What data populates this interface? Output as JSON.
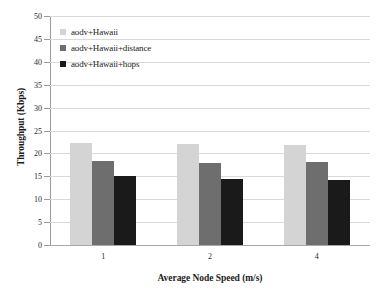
{
  "chart_data": {
    "type": "bar",
    "title": "",
    "xlabel": "Average Node Speed (m/s)",
    "ylabel": "Throughput (Kbps)",
    "categories": [
      "1",
      "2",
      "4"
    ],
    "series": [
      {
        "name": "aodv+Hawaii",
        "color": "#d4d4d4",
        "values": [
          22.2,
          22.0,
          21.8
        ]
      },
      {
        "name": "aodv+Hawaii+distance",
        "color": "#6e6e6e",
        "values": [
          18.4,
          18.0,
          18.1
        ]
      },
      {
        "name": "aodv+Hawaii+hops",
        "color": "#1a1a1a",
        "values": [
          15.0,
          14.5,
          14.3
        ]
      }
    ],
    "ylim": [
      0,
      50
    ],
    "ytick_step": 5,
    "yticks": [
      0,
      5,
      10,
      15,
      20,
      25,
      30,
      35,
      40,
      45,
      50
    ],
    "grid": "horizontal",
    "legend_position": "top-left",
    "gridline_color": "#d9d9d9",
    "axis_color": "#9a9a9a",
    "background": "#ffffff"
  }
}
